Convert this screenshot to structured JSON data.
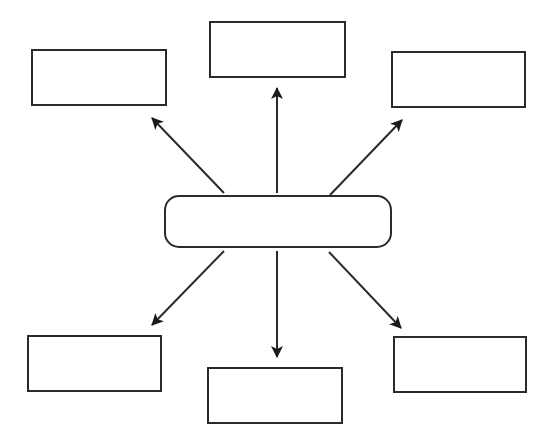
{
  "diagram": {
    "type": "spider-map",
    "stroke_color": "#2a2a2a",
    "background": "#ffffff",
    "center": {
      "label": "",
      "x": 164,
      "y": 195,
      "w": 228,
      "h": 53
    },
    "nodes": [
      {
        "id": "top-left",
        "label": "",
        "x": 31,
        "y": 49,
        "w": 136,
        "h": 57
      },
      {
        "id": "top-center",
        "label": "",
        "x": 209,
        "y": 21,
        "w": 137,
        "h": 57
      },
      {
        "id": "top-right",
        "label": "",
        "x": 391,
        "y": 51,
        "w": 135,
        "h": 57
      },
      {
        "id": "bottom-left",
        "label": "",
        "x": 27,
        "y": 335,
        "w": 135,
        "h": 57
      },
      {
        "id": "bottom-center",
        "label": "",
        "x": 207,
        "y": 367,
        "w": 136,
        "h": 57
      },
      {
        "id": "bottom-right",
        "label": "",
        "x": 393,
        "y": 336,
        "w": 134,
        "h": 57
      }
    ],
    "arrows": [
      {
        "id": "to-top-left",
        "x1": 224,
        "y1": 193,
        "x2": 152,
        "y2": 118
      },
      {
        "id": "to-top-center",
        "x1": 277,
        "y1": 193,
        "x2": 277,
        "y2": 88
      },
      {
        "id": "to-top-right",
        "x1": 330,
        "y1": 195,
        "x2": 402,
        "y2": 120
      },
      {
        "id": "to-bottom-left",
        "x1": 224,
        "y1": 251,
        "x2": 152,
        "y2": 325
      },
      {
        "id": "to-bottom-center",
        "x1": 277,
        "y1": 251,
        "x2": 277,
        "y2": 357
      },
      {
        "id": "to-bottom-right",
        "x1": 329,
        "y1": 252,
        "x2": 401,
        "y2": 328
      }
    ]
  }
}
